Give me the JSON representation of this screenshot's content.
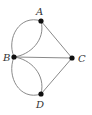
{
  "diagram": {
    "type": "multigraph",
    "nodes": [
      {
        "id": "A",
        "label": "A",
        "x": 41,
        "y": 21
      },
      {
        "id": "B",
        "label": "B",
        "x": 14,
        "y": 57
      },
      {
        "id": "C",
        "label": "C",
        "x": 72,
        "y": 58
      },
      {
        "id": "D",
        "label": "D",
        "x": 41,
        "y": 94
      }
    ],
    "edges": [
      {
        "from": "A",
        "to": "B",
        "shape": "curve-outer"
      },
      {
        "from": "A",
        "to": "B",
        "shape": "curve-inner"
      },
      {
        "from": "B",
        "to": "D",
        "shape": "curve-outer"
      },
      {
        "from": "B",
        "to": "D",
        "shape": "curve-inner"
      },
      {
        "from": "A",
        "to": "C",
        "shape": "straight"
      },
      {
        "from": "B",
        "to": "C",
        "shape": "straight"
      },
      {
        "from": "D",
        "to": "C",
        "shape": "straight"
      }
    ],
    "colors": {
      "edge": "#8a8a8a",
      "node": "#111111",
      "label": "#333333"
    }
  }
}
